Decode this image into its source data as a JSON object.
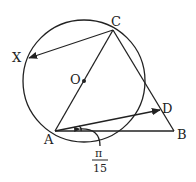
{
  "figure": {
    "points": {
      "A": {
        "label": "A"
      },
      "B": {
        "label": "B"
      },
      "C": {
        "label": "C"
      },
      "D": {
        "label": "D"
      },
      "X": {
        "label": "X"
      },
      "O": {
        "label": "O"
      }
    },
    "angle_annotation": {
      "numerator": "π",
      "denominator": "15",
      "between": [
        "AB",
        "AD"
      ]
    },
    "elements": [
      "circle with center O through A and C (AC is a diameter)",
      "triangle ABC",
      "vector C→X",
      "vector A→D with D on BC"
    ],
    "colors": {
      "ink": "#222222",
      "background": "#ffffff"
    }
  }
}
